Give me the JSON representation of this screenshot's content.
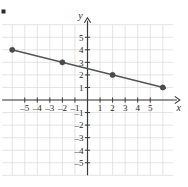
{
  "chart_data": {
    "type": "line",
    "title": "",
    "subtitle": "",
    "xlabel": "x",
    "ylabel": "y",
    "xlim": [
      -6.8,
      6.8
    ],
    "ylim": [
      -6.0,
      6.0
    ],
    "grid": true,
    "legend": false,
    "legend_position": "none",
    "equation": "y = -0.25x + 2.5",
    "slope": -0.25,
    "intercept": 2.5,
    "line": {
      "x_start": -6.1,
      "y_start": 4.025,
      "x_end": 6.2,
      "y_end": 0.95,
      "color": "#555555"
    },
    "points": [
      {
        "x": -6,
        "y": 4
      },
      {
        "x": -2,
        "y": 3
      },
      {
        "x": 2,
        "y": 2
      },
      {
        "x": 6,
        "y": 1
      }
    ],
    "point_color": "#4a4a4a",
    "x_ticks": [
      -5,
      -4,
      -3,
      -2,
      -1,
      1,
      2,
      3,
      4,
      5
    ],
    "x_tick_labels": [
      "-5",
      "-4",
      "-3",
      "-2",
      "-1",
      "1",
      "2",
      "3",
      "4",
      "5"
    ],
    "y_ticks": [
      5,
      4,
      3,
      2,
      1,
      -1,
      -2,
      -3,
      -4,
      -5
    ],
    "y_tick_labels": [
      "5",
      "4",
      "3",
      "2",
      "1",
      "-1",
      "-2",
      "-3",
      "-4",
      "-5"
    ],
    "axis_color": "#3a3a3a",
    "grid_color": "#d8d8d8",
    "corner_marker": true
  }
}
